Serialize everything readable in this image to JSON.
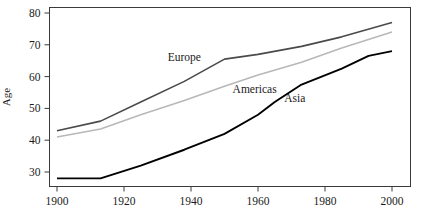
{
  "chart_data": {
    "type": "line",
    "title": "",
    "subtitle": "",
    "xlabel": "",
    "ylabel": "Age",
    "xlim": [
      1900,
      2000
    ],
    "ylim": [
      25,
      82
    ],
    "grid": false,
    "legend_position": "inline-annotations",
    "xticks": [
      1900,
      1920,
      1940,
      1960,
      1980,
      2000
    ],
    "xtick_labels": [
      "1900",
      "1920",
      "1940",
      "1960",
      "1980",
      "2000"
    ],
    "yticks": [
      30,
      40,
      50,
      60,
      70,
      80
    ],
    "ytick_labels": [
      "30",
      "40",
      "50",
      "60",
      "70",
      "80"
    ],
    "series": [
      {
        "name": "Europe",
        "color": "#4a4a4a",
        "width": 1.6,
        "label_x": 1938,
        "label_y": 65,
        "x": [
          1900,
          1913,
          1925,
          1938,
          1950,
          1960,
          1973,
          1985,
          2000
        ],
        "values": [
          43,
          46,
          52,
          58.5,
          65.5,
          67,
          69.5,
          72.5,
          77
        ]
      },
      {
        "name": "Americas",
        "color": "#b8b8b8",
        "width": 1.6,
        "label_x": 1959,
        "label_y": 55,
        "x": [
          1900,
          1913,
          1925,
          1938,
          1950,
          1960,
          1973,
          1985,
          2000
        ],
        "values": [
          41,
          43.5,
          48,
          52.5,
          57,
          60.5,
          64.5,
          69,
          74
        ]
      },
      {
        "name": "Asia",
        "color": "#000000",
        "width": 1.9,
        "label_x": 1971,
        "label_y": 52,
        "x": [
          1900,
          1913,
          1925,
          1938,
          1950,
          1960,
          1965,
          1973,
          1985,
          1993,
          2000
        ],
        "values": [
          28,
          28,
          32,
          37,
          42,
          48,
          52,
          57.5,
          62.5,
          66.5,
          68
        ]
      }
    ]
  },
  "axis": {
    "y_title": "Age"
  }
}
